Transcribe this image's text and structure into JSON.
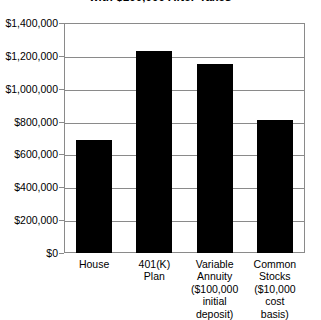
{
  "chart_data": {
    "type": "bar",
    "title": "with $100,000 After-Taxes",
    "xlabel": "",
    "ylabel": "",
    "categories": [
      "House",
      "401(K) Plan",
      "Variable Annuity ($100,000 initial deposit)",
      "Common Stocks ($10,000 cost basis)"
    ],
    "category_lines": [
      [
        "House"
      ],
      [
        "401(K)",
        "Plan"
      ],
      [
        "Variable",
        "Annuity",
        "($100,000",
        "initial",
        "deposit)"
      ],
      [
        "Common",
        "Stocks",
        "($10,000",
        "cost",
        "basis)"
      ]
    ],
    "values": [
      685000,
      1230000,
      1150000,
      810000
    ],
    "ylim": [
      0,
      1400000
    ],
    "ytick_values": [
      1400000,
      1200000,
      1000000,
      800000,
      600000,
      400000,
      200000,
      0
    ],
    "ytick_labels": [
      "$1,400,000",
      "$1,200,000",
      "$1,000,000",
      "$800,000",
      "$600,000",
      "$400,000",
      "$200,000",
      "$0"
    ],
    "grid": true,
    "legend": null,
    "bar_color": "#000000",
    "grid_color": "#8a8a8a",
    "background_color": "#ffffff"
  }
}
